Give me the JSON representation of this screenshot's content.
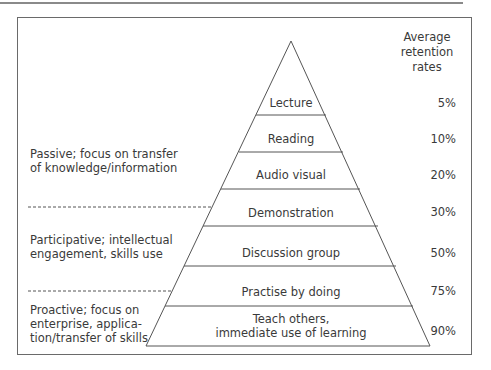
{
  "header": {
    "retention_title": "Average\nretention\nrates",
    "line1": "Average",
    "line2": "retention",
    "line3": "rates"
  },
  "layers": [
    {
      "label": "Lecture",
      "rate": "5%"
    },
    {
      "label": "Reading",
      "rate": "10%"
    },
    {
      "label": "Audio visual",
      "rate": "20%"
    },
    {
      "label": "Demonstration",
      "rate": "30%"
    },
    {
      "label": "Discussion group",
      "rate": "50%"
    },
    {
      "label": "Practise by doing",
      "rate": "75%"
    },
    {
      "label_line1": "Teach others,",
      "label_line2": "immediate use of learning",
      "rate": "90%"
    }
  ],
  "categories": [
    {
      "line1": "Passive; focus on transfer",
      "line2": "of knowledge/information"
    },
    {
      "line1": "Participative; intellectual",
      "line2": "engagement, skills use"
    },
    {
      "line1": "Proactive; focus on",
      "line2": "enterprise, applica-",
      "line3": "tion/transfer of skills"
    }
  ]
}
